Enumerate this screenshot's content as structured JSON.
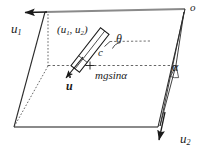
{
  "figure": {
    "type": "mechanics-schematic",
    "background_color": "#ffffff",
    "line_color": "#1a1a1a",
    "edge_color": "#787878",
    "labels": {
      "axis_u1": "u",
      "axis_u1_sub": "1",
      "axis_u2": "u",
      "axis_u2_sub": "2",
      "origin": "o",
      "position_open": "(",
      "position_u1": "u",
      "position_u1_sub": "1",
      "position_comma": ", ",
      "position_u2": "u",
      "position_u2_sub": "2",
      "position_close": ")",
      "angle_theta": "θ",
      "center_c": "c",
      "force_mgsina": "mgsinα",
      "incline_alpha": "α",
      "velocity_udot": "u"
    },
    "geometry": {
      "plane_corners": [
        {
          "name": "top-left",
          "x": 45,
          "y": 12
        },
        {
          "name": "top-right",
          "x": 185,
          "y": 9
        },
        {
          "name": "bottom-right",
          "x": 158,
          "y": 127
        },
        {
          "name": "bottom-left",
          "x": 14,
          "y": 127
        }
      ],
      "dashed_midline_y": 65,
      "block_angle_deg": 52,
      "block_center": {
        "x": 90,
        "y": 50
      }
    }
  }
}
